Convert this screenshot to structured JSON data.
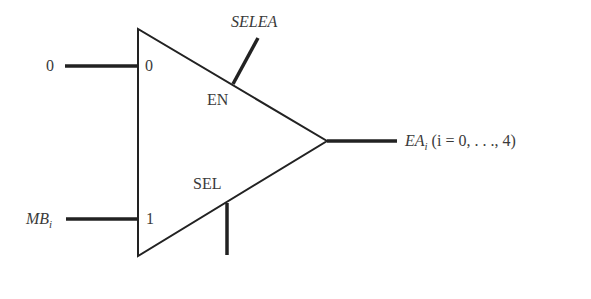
{
  "diagram": {
    "type": "multiplexer",
    "inputs": [
      {
        "signal": "0",
        "port": "0"
      },
      {
        "signal": "MB",
        "signal_sub": "i",
        "port": "1"
      }
    ],
    "control": {
      "enable": {
        "signal": "SELEA",
        "port": "EN"
      },
      "select": {
        "port": "SEL"
      }
    },
    "output": {
      "signal": "EA",
      "signal_sub": "i",
      "range": "(i = 0, . . ., 4)"
    }
  }
}
